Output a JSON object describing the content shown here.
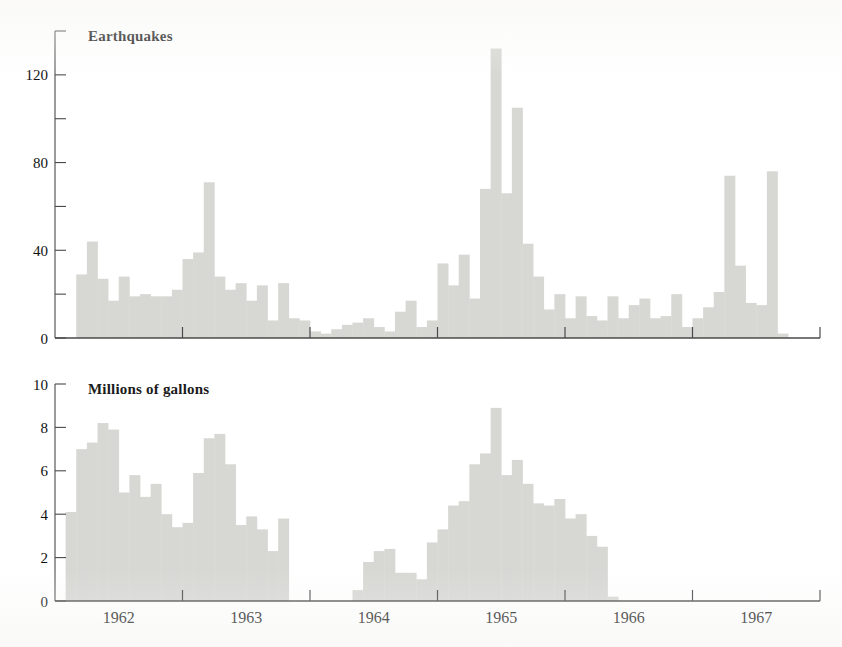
{
  "figure": {
    "background": "#ffffff",
    "bar_color": "#d7d7d4",
    "axis_color": "#4a4a4a",
    "text_color": "#111111",
    "width": 842,
    "height": 647
  },
  "panels": {
    "top": {
      "title": "Earthquakes",
      "y_ticks": [
        0,
        20,
        40,
        60,
        80,
        100,
        120,
        140
      ],
      "y_tick_labels": [
        "0",
        "",
        "40",
        "",
        "80",
        "",
        "120",
        ""
      ],
      "y_axis_min": 0,
      "y_axis_max": 140
    },
    "bottom": {
      "title": "Millions of gallons",
      "y_ticks": [
        0,
        2,
        4,
        6,
        8,
        10
      ],
      "y_tick_labels": [
        "0",
        "2",
        "4",
        "6",
        "8",
        "10"
      ],
      "y_axis_min": 0,
      "y_axis_max": 10
    }
  },
  "x_axis": {
    "year_labels": [
      "1962",
      "1963",
      "1964",
      "1965",
      "1966",
      "1967"
    ],
    "tick_years": [
      1963,
      1964,
      1965,
      1966,
      1967,
      1968
    ],
    "range_start_month": "1962-01",
    "range_end_month": "1967-12",
    "months_total": 72
  },
  "chart_data": [
    {
      "type": "bar",
      "id": "earthquakes",
      "title": "Earthquakes",
      "xlabel": "",
      "ylabel": "Earthquakes",
      "ylim": [
        0,
        140
      ],
      "yticks": [
        0,
        20,
        40,
        60,
        80,
        100,
        120,
        140
      ],
      "ytick_labels": [
        "0",
        "",
        "40",
        "",
        "80",
        "",
        "120",
        ""
      ],
      "grid": false,
      "legend": "none",
      "categories": [
        "1962-01",
        "1962-02",
        "1962-03",
        "1962-04",
        "1962-05",
        "1962-06",
        "1962-07",
        "1962-08",
        "1962-09",
        "1962-10",
        "1962-11",
        "1962-12",
        "1963-01",
        "1963-02",
        "1963-03",
        "1963-04",
        "1963-05",
        "1963-06",
        "1963-07",
        "1963-08",
        "1963-09",
        "1963-10",
        "1963-11",
        "1963-12",
        "1964-01",
        "1964-02",
        "1964-03",
        "1964-04",
        "1964-05",
        "1964-06",
        "1964-07",
        "1964-08",
        "1964-09",
        "1964-10",
        "1964-11",
        "1964-12",
        "1965-01",
        "1965-02",
        "1965-03",
        "1965-04",
        "1965-05",
        "1965-06",
        "1965-07",
        "1965-08",
        "1965-09",
        "1965-10",
        "1965-11",
        "1965-12",
        "1966-01",
        "1966-02",
        "1966-03",
        "1966-04",
        "1966-05",
        "1966-06",
        "1966-07",
        "1966-08",
        "1966-09",
        "1966-10",
        "1966-11",
        "1966-12",
        "1967-01",
        "1967-02",
        "1967-03",
        "1967-04",
        "1967-05",
        "1967-06",
        "1967-07",
        "1967-08",
        "1967-09",
        "1967-10",
        "1967-11",
        "1967-12"
      ],
      "values": [
        0,
        0,
        29,
        44,
        27,
        17,
        28,
        19,
        20,
        19,
        19,
        22,
        36,
        39,
        71,
        28,
        22,
        25,
        17,
        24,
        8,
        25,
        9,
        8,
        3,
        2,
        4,
        6,
        7,
        9,
        5,
        3,
        12,
        17,
        5,
        8,
        34,
        24,
        38,
        18,
        68,
        132,
        66,
        105,
        43,
        28,
        13,
        20,
        9,
        19,
        10,
        8,
        19,
        9,
        15,
        18,
        9,
        10,
        20,
        5,
        9,
        14,
        21,
        74,
        33,
        16,
        15,
        76,
        2,
        0,
        0,
        0
      ]
    },
    {
      "type": "bar",
      "id": "waste-injection",
      "title": "Millions of gallons",
      "xlabel": "",
      "ylabel": "Millions of gallons",
      "ylim": [
        0,
        10
      ],
      "yticks": [
        0,
        2,
        4,
        6,
        8,
        10
      ],
      "ytick_labels": [
        "0",
        "2",
        "4",
        "6",
        "8",
        "10"
      ],
      "grid": false,
      "legend": "none",
      "categories": [
        "1962-01",
        "1962-02",
        "1962-03",
        "1962-04",
        "1962-05",
        "1962-06",
        "1962-07",
        "1962-08",
        "1962-09",
        "1962-10",
        "1962-11",
        "1962-12",
        "1963-01",
        "1963-02",
        "1963-03",
        "1963-04",
        "1963-05",
        "1963-06",
        "1963-07",
        "1963-08",
        "1963-09",
        "1963-10",
        "1963-11",
        "1963-12",
        "1964-01",
        "1964-02",
        "1964-03",
        "1964-04",
        "1964-05",
        "1964-06",
        "1964-07",
        "1964-08",
        "1964-09",
        "1964-10",
        "1964-11",
        "1964-12",
        "1965-01",
        "1965-02",
        "1965-03",
        "1965-04",
        "1965-05",
        "1965-06",
        "1965-07",
        "1965-08",
        "1965-09",
        "1965-10",
        "1965-11",
        "1965-12",
        "1966-01",
        "1966-02",
        "1966-03",
        "1966-04",
        "1966-05",
        "1966-06",
        "1966-07",
        "1966-08",
        "1966-09",
        "1966-10",
        "1966-11",
        "1966-12",
        "1967-01",
        "1967-02",
        "1967-03",
        "1967-04",
        "1967-05",
        "1967-06",
        "1967-07",
        "1967-08",
        "1967-09",
        "1967-10",
        "1967-11",
        "1967-12"
      ],
      "values": [
        0,
        4.1,
        7.0,
        7.3,
        8.2,
        7.9,
        5.0,
        5.8,
        4.8,
        5.4,
        4.0,
        3.4,
        3.6,
        5.9,
        7.5,
        7.7,
        6.3,
        3.5,
        3.9,
        3.3,
        2.3,
        3.8,
        0,
        0,
        0,
        0,
        0,
        0,
        0.5,
        1.8,
        2.3,
        2.4,
        1.3,
        1.3,
        1.0,
        2.7,
        3.3,
        4.4,
        4.6,
        6.3,
        6.8,
        8.9,
        5.8,
        6.5,
        5.4,
        4.5,
        4.4,
        4.7,
        3.8,
        4.0,
        3.0,
        2.5,
        0.2,
        0,
        0,
        0,
        0,
        0,
        0,
        0,
        0,
        0,
        0,
        0,
        0,
        0,
        0,
        0,
        0,
        0,
        0,
        0
      ]
    }
  ]
}
